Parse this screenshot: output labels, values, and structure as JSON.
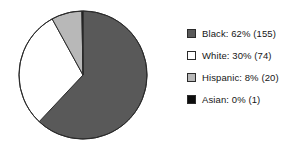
{
  "chart_data": {
    "type": "pie",
    "title": "",
    "subtitle": "",
    "xlabel": "",
    "ylabel": "",
    "grid": false,
    "legend_position": "right",
    "start_angle_deg": 0,
    "direction": "clockwise",
    "total_count": 250,
    "categories": [
      "Black",
      "White",
      "Hispanic",
      "Asian"
    ],
    "values": [
      62,
      30,
      8,
      0
    ],
    "counts": [
      155,
      74,
      20,
      1
    ],
    "unit": "%",
    "slices": [
      {
        "label": "Black",
        "percent": 62,
        "percent_text": "62%",
        "count": 155,
        "count_text": "(155)",
        "color": "#595959",
        "legend_text": "Black: 62% (155)",
        "start_deg": 0,
        "end_deg": 223.2
      },
      {
        "label": "White",
        "percent": 30,
        "percent_text": "30%",
        "count": 74,
        "count_text": "(74)",
        "color": "#ffffff",
        "legend_text": "White: 30% (74)",
        "start_deg": 223.2,
        "end_deg": 331.2
      },
      {
        "label": "Hispanic",
        "percent": 8,
        "percent_text": "8%",
        "count": 20,
        "count_text": "(20)",
        "color": "#b8b8b8",
        "legend_text": "Hispanic: 8% (20)",
        "start_deg": 331.2,
        "end_deg": 359.0
      },
      {
        "label": "Asian",
        "percent": 0,
        "percent_text": "0%",
        "count": 1,
        "count_text": "(1)",
        "color": "#0d0d0d",
        "legend_text": "Asian: 0% (1)",
        "start_deg": 359.0,
        "end_deg": 360
      }
    ]
  },
  "legend": {
    "items": [
      {
        "label": "Black: 62% (155)",
        "color": "#595959"
      },
      {
        "label": "White: 30% (74)",
        "color": "#ffffff"
      },
      {
        "label": "Hispanic: 8% (20)",
        "color": "#b8b8b8"
      },
      {
        "label": "Asian: 0% (1)",
        "color": "#0d0d0d"
      }
    ]
  },
  "colors": {
    "background": "#ffffff",
    "outline": "#2b2b2b",
    "text": "#161616",
    "black_slice": "#595959",
    "white_slice": "#ffffff",
    "hispanic_slice": "#b8b8b8",
    "asian_slice": "#0d0d0d"
  }
}
